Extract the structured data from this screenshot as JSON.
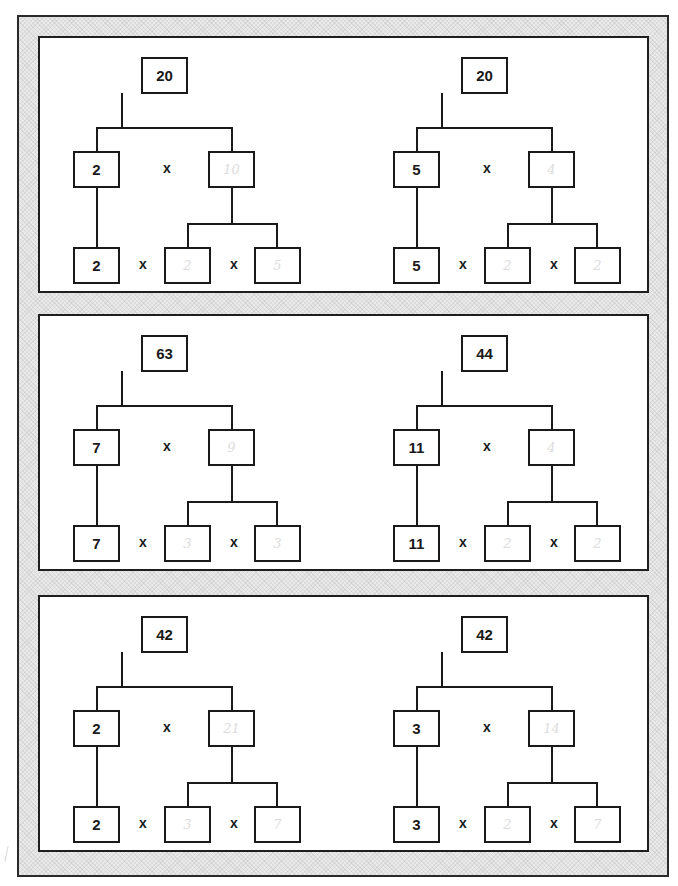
{
  "worksheet": {
    "operator_symbol": "x",
    "panels": [
      {
        "trees": [
          {
            "root": "20",
            "left": "2",
            "right": "10",
            "bottom_left": "2",
            "bottom_mid": "2",
            "bottom_right": "5"
          },
          {
            "root": "20",
            "left": "5",
            "right": "4",
            "bottom_left": "5",
            "bottom_mid": "2",
            "bottom_right": "2"
          }
        ]
      },
      {
        "trees": [
          {
            "root": "63",
            "left": "7",
            "right": "9",
            "bottom_left": "7",
            "bottom_mid": "3",
            "bottom_right": "3"
          },
          {
            "root": "44",
            "left": "11",
            "right": "4",
            "bottom_left": "11",
            "bottom_mid": "2",
            "bottom_right": "2"
          }
        ]
      },
      {
        "trees": [
          {
            "root": "42",
            "left": "2",
            "right": "21",
            "bottom_left": "2",
            "bottom_mid": "3",
            "bottom_right": "7"
          },
          {
            "root": "42",
            "left": "3",
            "right": "14",
            "bottom_left": "3",
            "bottom_mid": "2",
            "bottom_right": "7"
          }
        ]
      }
    ]
  },
  "colors": {
    "ink": "#1a1a1a",
    "handwriting": "#dcdcdc",
    "frame_fill": "#e9e9e9",
    "panel_fill": "#ffffff"
  }
}
